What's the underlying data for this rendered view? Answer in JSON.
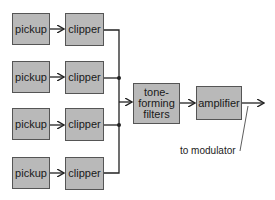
{
  "diagram": {
    "rows": [
      {
        "pickup": "pickup",
        "clipper": "clipper"
      },
      {
        "pickup": "pickup",
        "clipper": "clipper"
      },
      {
        "pickup": "pickup",
        "clipper": "clipper"
      },
      {
        "pickup": "pickup",
        "clipper": "clipper"
      }
    ],
    "filters": {
      "line1": "tone-",
      "line2": "forming",
      "line3": "filters"
    },
    "amplifier": "amplifier",
    "output_label": "to modulator"
  },
  "colors": {
    "box_fill": "#b9b9b9",
    "line": "#222222"
  }
}
